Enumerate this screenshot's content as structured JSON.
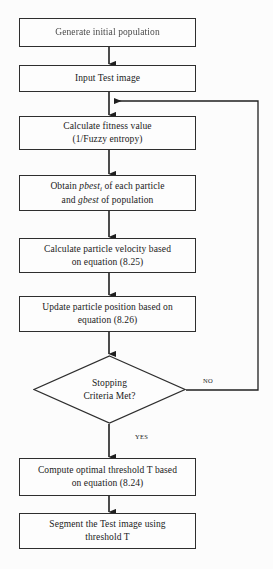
{
  "diagram": {
    "type": "flowchart",
    "background_color": "#fcfcfc",
    "stroke_color": "#2e2e2e",
    "text_color": "#1a1a1a"
  },
  "nodes": [
    {
      "id": "generate-initial-population",
      "shape": "process",
      "line1": "Generate initial population",
      "line2": ""
    },
    {
      "id": "input-test-image",
      "shape": "process",
      "line1": "Input Test image",
      "line2": ""
    },
    {
      "id": "calculate-fitness-value",
      "shape": "process",
      "line1": "Calculate fitness value",
      "line2": "(1/Fuzzy entropy)"
    },
    {
      "id": "obtain-pbest-gbest",
      "shape": "process",
      "line1_prefix": "Obtain ",
      "line1_italic": "pbest",
      "line1_subscript": "i",
      "line1_suffix": " of each particle",
      "line2_prefix": "and ",
      "line2_italic": "gbest",
      "line2_suffix": " of population"
    },
    {
      "id": "calculate-particle-velocity",
      "shape": "process",
      "line1": "Calculate particle velocity based",
      "line2": "on equation (8.25)"
    },
    {
      "id": "update-particle-position",
      "shape": "process",
      "line1": "Update particle position based on",
      "line2": "equation (8.26)"
    },
    {
      "id": "stopping-criteria-met",
      "shape": "decision",
      "line1": "Stopping",
      "line2": "Criteria Met?"
    },
    {
      "id": "compute-optimal-threshold",
      "shape": "process",
      "line1": "Compute optimal threshold T based",
      "line2": "on equation (8.24)"
    },
    {
      "id": "segment-test-image",
      "shape": "process",
      "line1": "Segment the Test image using",
      "line2": "threshold T"
    }
  ],
  "edge_labels": {
    "no": "NO",
    "yes": "YES"
  }
}
